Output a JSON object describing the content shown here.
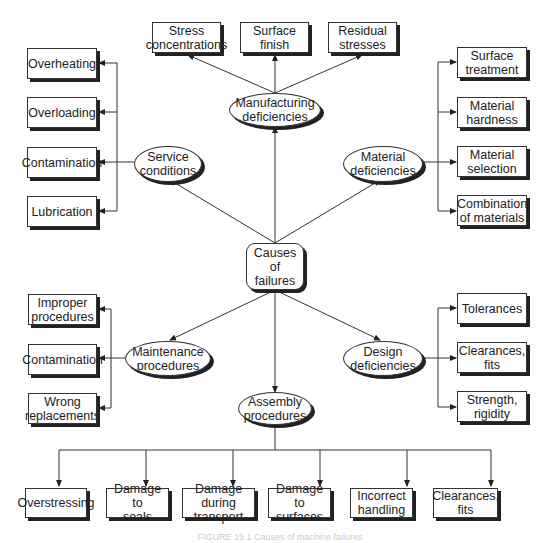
{
  "diagram": {
    "center": {
      "label": "Causes of\nfailures"
    },
    "categories": {
      "manufacturing": {
        "label": "Manufacturing\ndeficiencies",
        "children": [
          "Stress\nconcentrations",
          "Surface finish",
          "Residual\nstresses"
        ]
      },
      "service": {
        "label": "Service\nconditions",
        "children": [
          "Overheating",
          "Overloading",
          "Contamination",
          "Lubrication"
        ]
      },
      "material": {
        "label": "Material\ndeficiencies",
        "children": [
          "Surface\ntreatment",
          "Material\nhardness",
          "Material\nselection",
          "Combination\nof materials"
        ]
      },
      "maintenance": {
        "label": "Maintenance\nprocedures",
        "children": [
          "Improper\nprocedures",
          "Contamination",
          "Wrong\nreplacements"
        ]
      },
      "design": {
        "label": "Design\ndeficiencies",
        "children": [
          "Tolerances",
          "Clearances,\nfits",
          "Strength,\nrigidity"
        ]
      },
      "assembly": {
        "label": "Assembly\nprocedures",
        "children": [
          "Overstressing",
          "Damage to\nseals",
          "Damage during\ntransport",
          "Damage to\nsurfaces",
          "Incorrect\nhandling",
          "Clearances,\nfits"
        ]
      }
    },
    "caption": "FIGURE 19.1 Causes of machine failures"
  }
}
